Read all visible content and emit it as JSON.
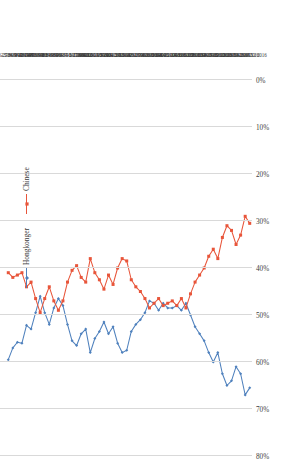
{
  "chart_data": {
    "type": "line",
    "title": "",
    "subtitle": "",
    "xlabel": "",
    "ylabel": "",
    "orientation": "rotated-90-ccw",
    "grid": true,
    "legend_position": "top-left",
    "ylim": [
      0,
      80
    ],
    "value_axis_ticks": [
      "80%",
      "70%",
      "60%",
      "50%",
      "40%",
      "30%",
      "20%",
      "10%",
      "0%"
    ],
    "value_axis_tick_numbers": [
      80,
      70,
      60,
      50,
      40,
      30,
      20,
      10,
      0
    ],
    "colors": {
      "hongkonger": "#4F81BD",
      "chinese": "#E8553A",
      "grid": "#D9D9D9",
      "text": "#404040"
    },
    "categories": [
      "26-27/8/1997",
      "23-24/9/1997",
      "28-29/10/1997",
      "8-9/12/1997",
      "3-4/6/1998",
      "22-24/6/1998",
      "14/8/1998",
      "29/9/1998",
      "21/12/1998",
      "8-9/2/1999",
      "13/4/1999",
      "8/6/1999",
      "9/9/1999",
      "26-27/10/1999",
      "13-15/12/1999",
      "1-2/2/2000",
      "6-17/4/2000",
      "7-8/8/2000",
      "21-25/9/2000",
      "4-12/12/2000",
      "22-24/5/2001",
      "1-5/9/2001",
      "13-19/9/2001",
      "7-9/12/2001",
      "12-13/5/2002",
      "4-5/9/2002",
      "2-5/9/2002",
      "13-16/12/2002",
      "1-4/3/2003",
      "13-18/9/2003",
      "10-14/12/2003",
      "7-11/6/2004",
      "6-9/12/2004",
      "6-8/6/2005",
      "9-14/12/2005",
      "6-13/6/2006",
      "6-12/12/2006",
      "11-14/12/2007",
      "11-13/6/2008",
      "9-12/12/2008",
      "8-11/12/2009",
      "8-13/6/2009",
      "13-16/12/2010",
      "21-23/6/2010",
      "12-20/12/2011",
      "14-17/12/2012",
      "10-13/6/2013",
      "9-12/12/2013",
      "6-12/6/2014",
      "10-16/12/2014",
      "13-16/6/2015",
      "3-7/12/2015",
      "10-16/6/2016",
      "12-13/12/2016"
    ],
    "series": [
      {
        "name": "Hongkonger",
        "color": "#4F81BD",
        "values": [
          59.5,
          57.0,
          55.8,
          56.0,
          52.2,
          53.0,
          49.5,
          46.0,
          49.5,
          52.0,
          48.5,
          46.5,
          48.0,
          52.0,
          55.5,
          56.5,
          54.0,
          53.0,
          58.0,
          55.0,
          53.5,
          51.5,
          54.0,
          52.5,
          56.0,
          58.0,
          57.5,
          53.5,
          52.0,
          51.0,
          49.5,
          47.0,
          47.5,
          49.0,
          47.5,
          48.5,
          48.5,
          48.0,
          49.0,
          47.5,
          50.0,
          52.5,
          54.0,
          55.5,
          58.0,
          60.0,
          58.0,
          62.5,
          65.0,
          64.0,
          61.0,
          62.5,
          67.0,
          65.5
        ]
      },
      {
        "name": "Chinese",
        "color": "#E8553A",
        "values": [
          41.0,
          42.0,
          41.5,
          41.0,
          44.0,
          43.0,
          46.5,
          49.5,
          46.5,
          44.0,
          47.0,
          49.0,
          47.0,
          43.0,
          40.5,
          39.5,
          42.0,
          43.0,
          38.0,
          41.0,
          42.5,
          44.5,
          41.5,
          43.5,
          40.0,
          38.0,
          38.5,
          42.5,
          44.0,
          45.0,
          46.5,
          48.5,
          47.5,
          46.5,
          48.0,
          47.5,
          47.0,
          48.0,
          46.5,
          48.5,
          45.5,
          43.0,
          41.5,
          40.0,
          37.5,
          36.0,
          38.0,
          33.5,
          31.0,
          32.0,
          35.0,
          33.0,
          29.0,
          30.5
        ]
      }
    ]
  },
  "legend": {
    "items": [
      {
        "label": "Hongkonger",
        "color": "#4F81BD"
      },
      {
        "label": "Chinese",
        "color": "#E8553A"
      }
    ]
  }
}
